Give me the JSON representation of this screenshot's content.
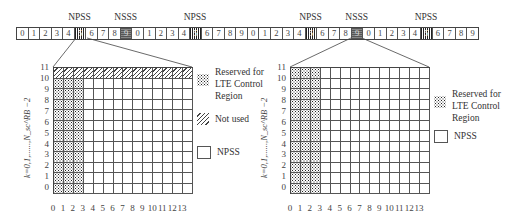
{
  "top_strip": {
    "cells": [
      "0",
      "1",
      "2",
      "3",
      "4",
      "5",
      "6",
      "7",
      "8",
      "9",
      "0",
      "1",
      "2",
      "3",
      "4",
      "5",
      "6",
      "7",
      "8",
      "9",
      "0",
      "1",
      "2",
      "3",
      "4",
      "5",
      "6",
      "7",
      "8",
      "9",
      "0",
      "1",
      "2",
      "3",
      "4",
      "5",
      "6",
      "7",
      "8",
      "9"
    ],
    "types": [
      "n",
      "n",
      "n",
      "n",
      "n",
      "npss",
      "n",
      "n",
      "n",
      "nsss",
      "n",
      "n",
      "n",
      "n",
      "n",
      "npss",
      "n",
      "n",
      "n",
      "n",
      "n",
      "n",
      "n",
      "n",
      "n",
      "npss",
      "n",
      "n",
      "n",
      "nsss",
      "n",
      "n",
      "n",
      "n",
      "n",
      "npss",
      "n",
      "n",
      "n",
      "n"
    ],
    "labels": [
      {
        "text": "NPSS",
        "cell": 5
      },
      {
        "text": "NSSS",
        "cell": 9
      },
      {
        "text": "NPSS",
        "cell": 15
      },
      {
        "text": "NPSS",
        "cell": 25
      },
      {
        "text": "NSSS",
        "cell": 29
      },
      {
        "text": "NPSS",
        "cell": 35
      }
    ]
  },
  "left_panel": {
    "zoom_from_cell": 5,
    "y_axis_label": "k=0,1,......,N_sc^RB −2",
    "y_ticks": [
      "11",
      "10",
      "9",
      "8",
      "7",
      "6",
      "5",
      "4",
      "3",
      "2",
      "1",
      "0"
    ],
    "x_ticks": [
      "0",
      "1",
      "2",
      "3",
      "4",
      "5",
      "6",
      "7",
      "8",
      "9",
      "10",
      "11",
      "12",
      "13"
    ],
    "rows": 12,
    "cols": 14,
    "reserved_columns": [
      0,
      1,
      2
    ],
    "not_used_rows": [
      11
    ],
    "legend": [
      {
        "pattern": "ctrl",
        "label_lines": [
          "Reserved for",
          "LTE Control",
          "Region"
        ]
      },
      {
        "pattern": "unused",
        "label_lines": [
          "Not used"
        ]
      },
      {
        "pattern": "npss",
        "label_lines": [
          "NPSS"
        ]
      }
    ]
  },
  "right_panel": {
    "zoom_from_cell": 29,
    "y_axis_label": "k=0,1,......,N_sc^RB −2",
    "y_ticks": [
      "11",
      "10",
      "9",
      "8",
      "7",
      "6",
      "5",
      "4",
      "3",
      "2",
      "1",
      "0"
    ],
    "x_ticks": [
      "0",
      "1",
      "2",
      "3",
      "4",
      "5",
      "6",
      "7",
      "8",
      "9",
      "10",
      "11",
      "12",
      "13"
    ],
    "rows": 12,
    "cols": 14,
    "reserved_columns": [
      0,
      1,
      2
    ],
    "not_used_rows": [],
    "legend": [
      {
        "pattern": "ctrl",
        "label_lines": [
          "Reserved for",
          "LTE Control",
          "Region"
        ]
      },
      {
        "pattern": "npss",
        "label_lines": [
          "NPSS"
        ]
      }
    ]
  }
}
